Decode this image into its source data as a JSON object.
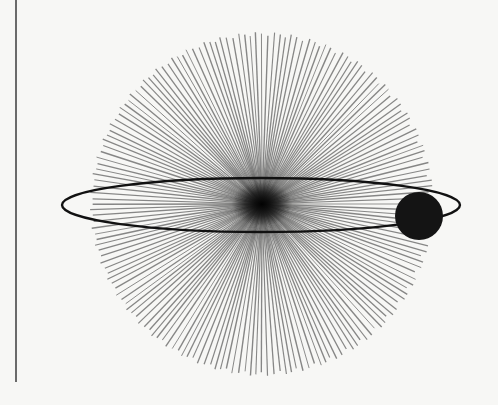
{
  "figure": {
    "kind": "illustration",
    "background_color": "#f7f7f5",
    "ink_color": "#111111"
  },
  "margin_line": {
    "x": 15,
    "y_top": 0,
    "y_bottom": 382,
    "color": "#6a6a6a"
  },
  "starburst": {
    "center": [
      262,
      204
    ],
    "radius": 172,
    "ray_count": 180,
    "ray_color": "#2a2a2a",
    "ray_opacity": 0.55,
    "core_radius": 22,
    "core_color": "#0d0d0d"
  },
  "orbit": {
    "center": [
      261,
      205
    ],
    "rx": 199,
    "ry": 27,
    "stroke": "#111111",
    "stroke_width": 2.4
  },
  "planet": {
    "center": [
      419,
      216
    ],
    "radius": 24,
    "fill": "#141414"
  }
}
